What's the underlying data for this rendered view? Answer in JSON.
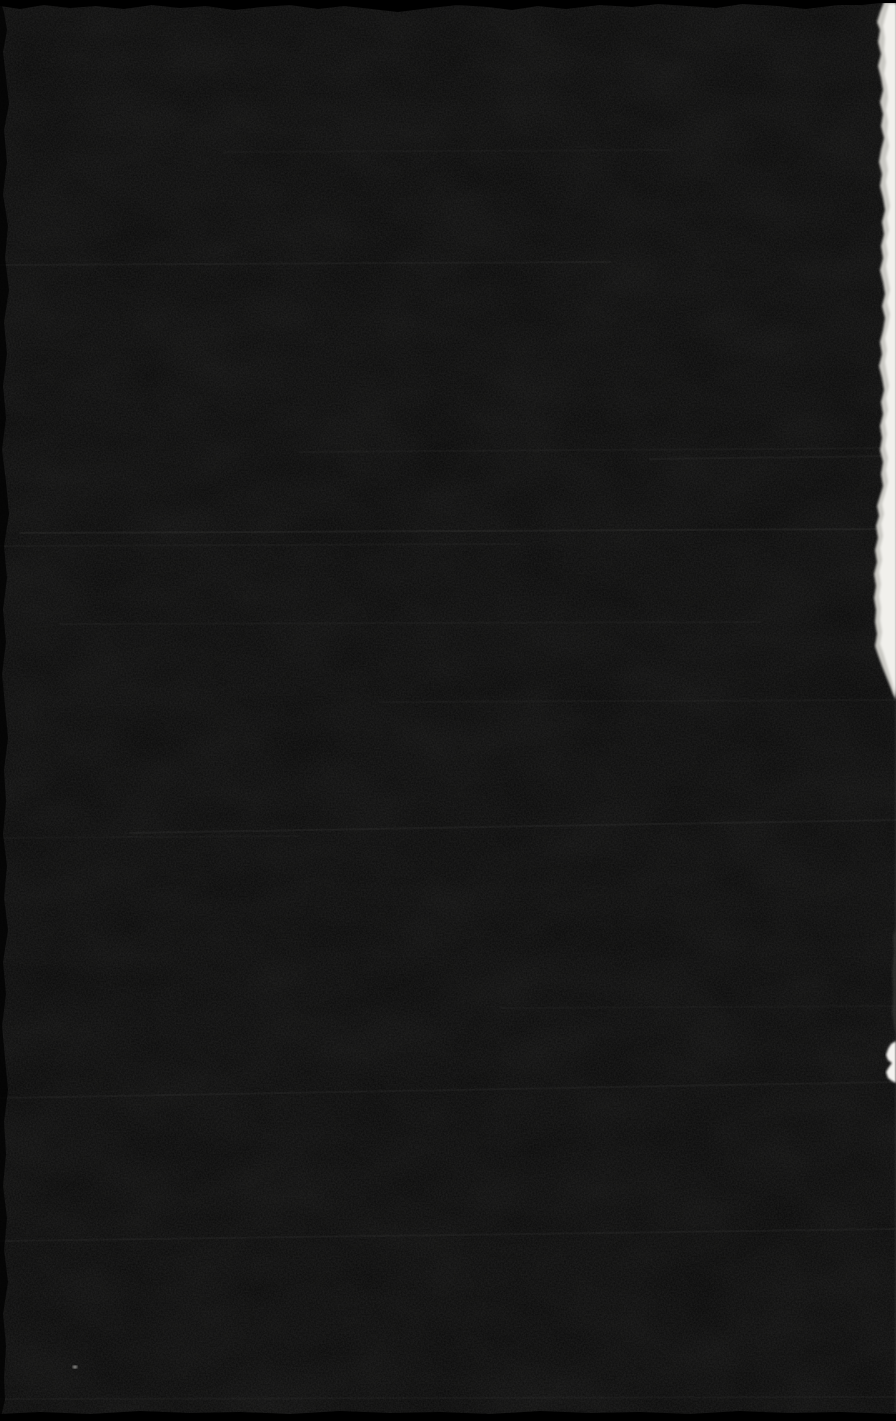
{
  "scan": {
    "visible_text": "",
    "colors": {
      "background": "#000000",
      "page": "#0a0a0a",
      "scanner_margin": "#000000",
      "grain": "#999996",
      "streak": "#a0a09c",
      "paper_edge_base": "#c9c8c3",
      "paper_edge_bright": "#f1f0ec",
      "paper_blob": "#f4f3f0",
      "edge_smear": "#55544f",
      "right_edge_line": "#3c3c3a",
      "speck": "#c9c9c4"
    },
    "streaks": [
      {
        "x1": 224,
        "y1": 152,
        "x2": 672,
        "y2": 150,
        "opacity": 0.03
      },
      {
        "x1": 0,
        "y1": 265,
        "x2": 610,
        "y2": 262,
        "opacity": 0.05
      },
      {
        "x1": 300,
        "y1": 452,
        "x2": 896,
        "y2": 448,
        "opacity": 0.04
      },
      {
        "x1": 650,
        "y1": 459,
        "x2": 896,
        "y2": 456,
        "opacity": 0.05
      },
      {
        "x1": 20,
        "y1": 533,
        "x2": 896,
        "y2": 529,
        "opacity": 0.07
      },
      {
        "x1": 0,
        "y1": 546,
        "x2": 520,
        "y2": 544,
        "opacity": 0.04
      },
      {
        "x1": 60,
        "y1": 624,
        "x2": 760,
        "y2": 622,
        "opacity": 0.04
      },
      {
        "x1": 380,
        "y1": 702,
        "x2": 896,
        "y2": 700,
        "opacity": 0.04
      },
      {
        "x1": 130,
        "y1": 833,
        "x2": 896,
        "y2": 820,
        "opacity": 0.06
      },
      {
        "x1": 0,
        "y1": 838,
        "x2": 300,
        "y2": 836,
        "opacity": 0.03
      },
      {
        "x1": 500,
        "y1": 1008,
        "x2": 896,
        "y2": 1006,
        "opacity": 0.03
      },
      {
        "x1": 0,
        "y1": 1098,
        "x2": 896,
        "y2": 1082,
        "opacity": 0.05
      },
      {
        "x1": 0,
        "y1": 1241,
        "x2": 896,
        "y2": 1229,
        "opacity": 0.05
      },
      {
        "x1": 0,
        "y1": 1399,
        "x2": 896,
        "y2": 1397,
        "opacity": 0.04
      }
    ],
    "torn_edge_outer_points": "896,2 884,2 880,12 877,22 880,30 878,42 881,54 878,66 881,78 883,90 880,102 883,114 881,126 884,138 881,150 879,162 882,174 880,186 883,198 885,210 882,222 884,234 881,246 883,258 880,270 883,282 885,294 882,306 885,318 883,330 880,342 882,354 879,366 882,378 884,390 881,402 883,414 880,426 882,438 880,450 883,462 881,474 883,486 880,496 877,506 879,516 876,526 878,538 875,550 877,562 874,574 876,586 874,598 876,610 875,622 877,634 875,646 878,655 882,666 886,676 890,686 893,694 896,700",
    "torn_edge_bright_points": "896,4 889,4 886,14 883,26 885,38 884,50 886,62 884,74 887,86 888,98 886,110 888,122 887,134 889,146 886,158 888,170 886,182 888,194 890,206 887,218 889,230 886,242 888,254 886,266 888,278 890,290 887,302 890,314 888,326 885,338 887,350 885,362 887,374 889,386 886,398 888,410 885,422 887,434 885,446 888,458 886,470 888,482 885,494 882,504 884,514 881,524 883,536 880,548 882,560 879,572 881,584 879,596 881,608 880,620 882,632 880,644 883,652 886,662 889,672 892,682 894,690 896,696",
    "paper_blob_points": "896,1041 891,1044 888,1049 886,1055 888,1060 892,1063 889,1067 886,1072 888,1078 892,1081 896,1083",
    "edge_smear_points": "896,928 893,936 894,952 892,972 893,992 892,1012 894,1026 896,1034",
    "right_edge_line": {
      "x": 894.5,
      "y": 700,
      "width": 1.5,
      "height": 712,
      "opacity": 0.28
    },
    "top_strip_points": "0,0 896,0 896,3 880,3 862,5 838,5 806,9 778,6 742,4 716,8 688,6 658,4 632,7 600,5 566,9 538,6 512,10 488,7 458,5 430,8 398,12 372,9 344,6 318,9 290,5 262,7 234,10 206,6 180,8 152,5 124,9 96,6 70,8 44,5 20,9 0,6",
    "bottom_strip_points": "0,1421 0,1414 40,1412 90,1414 140,1411 190,1413 240,1412 290,1414 340,1411 390,1413 440,1412 490,1414 540,1411 590,1413 640,1412 690,1414 740,1411 790,1413 840,1412 896,1414 896,1421",
    "left_scallop_points": "0,0 4,12 7,30 3,52 6,78 9,104 4,130 7,162 3,194 8,226 5,258 9,290 4,322 7,354 3,386 6,418 2,450 6,482 9,514 4,546 7,578 3,610 6,642 2,674 5,706 8,738 4,770 6,802 3,834 7,866 4,898 8,930 3,962 6,994 2,1026 5,1058 8,1090 4,1122 6,1154 3,1186 7,1218 4,1250 8,1282 3,1314 6,1346 4,1378 5,1400 0,1421",
    "speck": {
      "cx": 75,
      "cy": 1367,
      "rx": 2.5,
      "ry": 1.2,
      "opacity": 0.85
    }
  }
}
